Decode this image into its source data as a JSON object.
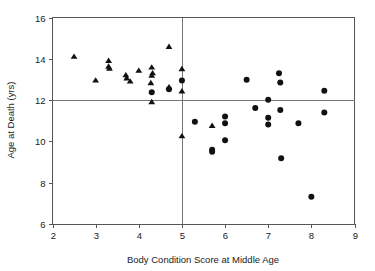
{
  "chart_data": {
    "type": "scatter",
    "title": "",
    "xlabel": "Body Condition Score at Middle Age",
    "ylabel": "Age at Death (yrs)",
    "xlim": [
      2,
      9
    ],
    "ylim": [
      6,
      16
    ],
    "xticks": [
      2,
      3,
      4,
      5,
      6,
      7,
      8,
      9
    ],
    "xtick_labels": [
      "2",
      "3",
      "4",
      "5",
      "6",
      "7",
      "8",
      "9"
    ],
    "yticks": [
      6,
      8,
      10,
      12,
      14,
      16
    ],
    "ytick_labels": [
      "6",
      "8",
      "10",
      "12",
      "14",
      "16"
    ],
    "grid": false,
    "legend": "none",
    "reference_lines": [
      {
        "orientation": "vertical",
        "value": 5,
        "color": "#777777"
      },
      {
        "orientation": "horizontal",
        "value": 12,
        "color": "#777777"
      }
    ],
    "marker_colors": {
      "triangle": "#111111",
      "circle": "#111111"
    },
    "series": [
      {
        "name": "triangle",
        "marker": "triangle",
        "points": [
          [
            2.5,
            14.1
          ],
          [
            3.0,
            12.95
          ],
          [
            3.3,
            13.9
          ],
          [
            3.3,
            13.62
          ],
          [
            3.32,
            13.52
          ],
          [
            3.7,
            13.2
          ],
          [
            3.72,
            13.05
          ],
          [
            3.8,
            12.9
          ],
          [
            4.0,
            13.42
          ],
          [
            4.28,
            12.82
          ],
          [
            4.3,
            13.58
          ],
          [
            4.32,
            13.3
          ],
          [
            4.3,
            13.18
          ],
          [
            4.3,
            11.9
          ],
          [
            4.7,
            14.58
          ],
          [
            4.7,
            12.62
          ],
          [
            5.0,
            13.5
          ],
          [
            5.0,
            12.42
          ],
          [
            5.0,
            10.25
          ],
          [
            5.7,
            10.75
          ]
        ]
      },
      {
        "name": "circle",
        "marker": "circle",
        "points": [
          [
            4.3,
            12.38
          ],
          [
            4.7,
            12.52
          ],
          [
            5.0,
            12.95
          ],
          [
            5.3,
            10.95
          ],
          [
            5.7,
            9.6
          ],
          [
            5.7,
            9.5
          ],
          [
            6.0,
            11.2
          ],
          [
            6.0,
            10.88
          ],
          [
            6.0,
            10.05
          ],
          [
            6.5,
            12.98
          ],
          [
            6.7,
            11.62
          ],
          [
            7.0,
            12.02
          ],
          [
            7.0,
            11.15
          ],
          [
            7.0,
            10.82
          ],
          [
            7.25,
            13.3
          ],
          [
            7.28,
            12.85
          ],
          [
            7.28,
            11.52
          ],
          [
            7.3,
            9.18
          ],
          [
            7.7,
            10.88
          ],
          [
            8.0,
            7.32
          ],
          [
            8.3,
            12.45
          ],
          [
            8.3,
            11.4
          ]
        ]
      }
    ]
  }
}
